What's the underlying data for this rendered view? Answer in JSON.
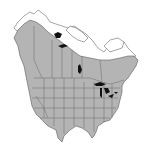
{
  "map": {
    "type": "species-range-map",
    "region": "North America",
    "legend": [
      {
        "label": "Range",
        "color": "#b4b4b4"
      },
      {
        "label": "Outside range",
        "color": "#ffffff"
      },
      {
        "label": "Great Lakes / large lakes",
        "color": "#111111"
      }
    ],
    "colors": {
      "range_fill": "#b4b4b4",
      "border": "#6a6a6a",
      "water": "#111111",
      "background": "#ffffff"
    }
  }
}
